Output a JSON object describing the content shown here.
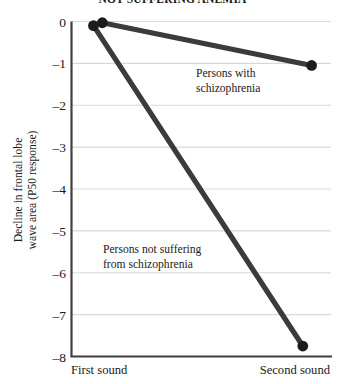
{
  "chart_data": {
    "type": "line",
    "title": "NOT SUFFERING ANEMIA",
    "categories": [
      "First sound",
      "Second sound"
    ],
    "xlabel": "",
    "ylabel_line1": "Decline in frontal lobe",
    "ylabel_line2": "wave area (P50 response)",
    "ylim": [
      -8,
      0
    ],
    "yticks": [
      0,
      -1,
      -2,
      -3,
      -4,
      -5,
      -6,
      -7,
      -8
    ],
    "ytick_labels": [
      "0",
      "–1",
      "–2",
      "–3",
      "–4",
      "–5",
      "–6",
      "–7",
      "–8"
    ],
    "grid": true,
    "legend_position": "inline-annotations",
    "series": [
      {
        "name": "Persons with schizophrenia",
        "color": "#3b3b3b",
        "x_offset": 0.022,
        "values": [
          -0.03,
          -1.05
        ],
        "annotation_line1": "Persons with",
        "annotation_line2": "schizophrenia"
      },
      {
        "name": "Persons not suffering from schizophrenia",
        "color": "#3b3b3b",
        "x_offset": -0.012,
        "values": [
          -0.1,
          -7.75
        ],
        "annotation_line1": "Persons not suffering",
        "annotation_line2": "from schizophrenia"
      }
    ],
    "colors": {
      "line": "#3b3b3b",
      "marker": "#1c1c1c",
      "grid": "#d9d9d9",
      "axis": "#3f3f3f",
      "background": "#ffffff"
    }
  }
}
